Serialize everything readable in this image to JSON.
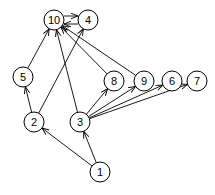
{
  "diagram": {
    "type": "directed-graph",
    "node_radius": 10,
    "nodes": [
      {
        "id": "10",
        "label": "10",
        "x": 54,
        "y": 20
      },
      {
        "id": "4",
        "label": "4",
        "x": 88,
        "y": 20
      },
      {
        "id": "5",
        "label": "5",
        "x": 23,
        "y": 77
      },
      {
        "id": "8",
        "label": "8",
        "x": 114,
        "y": 81
      },
      {
        "id": "9",
        "label": "9",
        "x": 144,
        "y": 81
      },
      {
        "id": "6",
        "label": "6",
        "x": 172,
        "y": 81
      },
      {
        "id": "7",
        "label": "7",
        "x": 197,
        "y": 81
      },
      {
        "id": "2",
        "label": "2",
        "x": 34,
        "y": 122
      },
      {
        "id": "3",
        "label": "3",
        "x": 80,
        "y": 122
      },
      {
        "id": "1",
        "label": "1",
        "x": 100,
        "y": 172
      }
    ],
    "edges": [
      {
        "from": "10",
        "to": "4",
        "offset": -4
      },
      {
        "from": "4",
        "to": "10",
        "offset": -4
      },
      {
        "from": "5",
        "to": "10"
      },
      {
        "from": "2",
        "to": "5"
      },
      {
        "from": "2",
        "to": "4"
      },
      {
        "from": "3",
        "to": "10"
      },
      {
        "from": "8",
        "to": "10"
      },
      {
        "from": "9",
        "to": "10"
      },
      {
        "from": "3",
        "to": "8"
      },
      {
        "from": "3",
        "to": "9"
      },
      {
        "from": "3",
        "to": "6"
      },
      {
        "from": "3",
        "to": "7"
      },
      {
        "from": "1",
        "to": "2"
      },
      {
        "from": "1",
        "to": "3"
      }
    ]
  }
}
